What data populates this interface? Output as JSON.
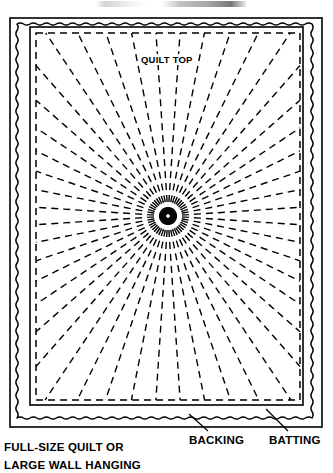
{
  "figure": {
    "kind": "quilt-layer-diagram",
    "caption_line_1": "FULL-SIZE QUILT OR",
    "caption_line_2": "LARGE WALL HANGING",
    "top_artifact": ""
  },
  "labels": {
    "quilt_top": "QUILT TOP",
    "backing": "BACKING",
    "batting": "BATTING"
  },
  "colors": {
    "ink": "#000000",
    "paper": "#ffffff"
  },
  "geometry": {
    "outer_rect": {
      "x": 10,
      "y": 18,
      "w": 312,
      "h": 409
    },
    "wavy_rect": {
      "x": 17,
      "y": 24,
      "w": 295,
      "h": 394,
      "amplitude": 2.2,
      "wavelength": 13
    },
    "inner_rect": {
      "x": 30,
      "y": 27,
      "w": 273,
      "h": 378
    },
    "stitch_rect": {
      "x": 36,
      "y": 33,
      "w": 264,
      "h": 367
    },
    "radial_center": {
      "x": 168,
      "y": 216
    },
    "ray_count": 48,
    "dash_pattern": "7 5"
  },
  "leaders": {
    "backing": {
      "x1": 208,
      "y1": 431,
      "x2": 189,
      "y2": 414
    },
    "batting": {
      "x1": 288,
      "y1": 431,
      "x2": 266,
      "y2": 409
    }
  },
  "chart_data": {
    "type": "diagram",
    "annotations": [
      "QUILT TOP",
      "BACKING",
      "BATTING"
    ],
    "layers": [
      {
        "name": "QUILT TOP",
        "depiction": "innermost rectangle with radiating dashed quilting lines"
      },
      {
        "name": "BACKING",
        "depiction": "middle solid rectangle border extending beyond quilt top"
      },
      {
        "name": "BATTING",
        "depiction": "wavy outline between backing and outer edge"
      }
    ]
  }
}
